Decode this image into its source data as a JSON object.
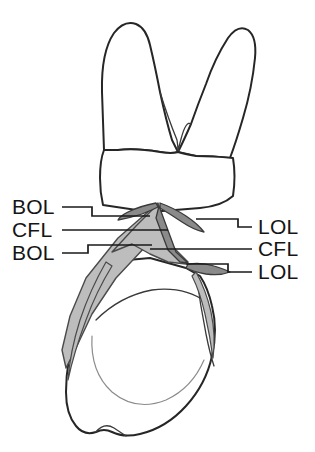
{
  "figure": {
    "background_color": "#ffffff",
    "outline_color": "#262626",
    "shade_light_color": "#bdbdbd",
    "shade_dark_color": "#8a8a8a",
    "label_color": "#151515"
  },
  "labels": {
    "left": [
      {
        "id": "left-bol-upper",
        "text": "BOL",
        "x": 12,
        "y": 214
      },
      {
        "id": "left-cfl",
        "text": "CFL",
        "x": 12,
        "y": 237
      },
      {
        "id": "left-bol-lower",
        "text": "BOL",
        "x": 12,
        "y": 260
      }
    ],
    "right": [
      {
        "id": "right-lol-upper",
        "text": "LOL",
        "x": 258,
        "y": 234
      },
      {
        "id": "right-cfl",
        "text": "CFL",
        "x": 258,
        "y": 256
      },
      {
        "id": "right-lol-lower",
        "text": "LOL",
        "x": 258,
        "y": 279
      }
    ]
  },
  "legend_meaning": {
    "BOL": "BOL",
    "CFL": "CFL",
    "LOL": "LOL"
  },
  "leaders": {
    "left_bol_upper": "M62,207 L92,207 L92,216 L150,216",
    "left_cfl": "M62,230 L168,230",
    "left_bol_lower": "M62,253 L88,253 L88,245 L152,245",
    "right_lol_upper": "M252,227 L238,227 L238,219 L196,219",
    "right_cfl": "M252,249 L150,249",
    "right_lol_lower": "M252,272 L228,272 L228,264 L186,264"
  }
}
